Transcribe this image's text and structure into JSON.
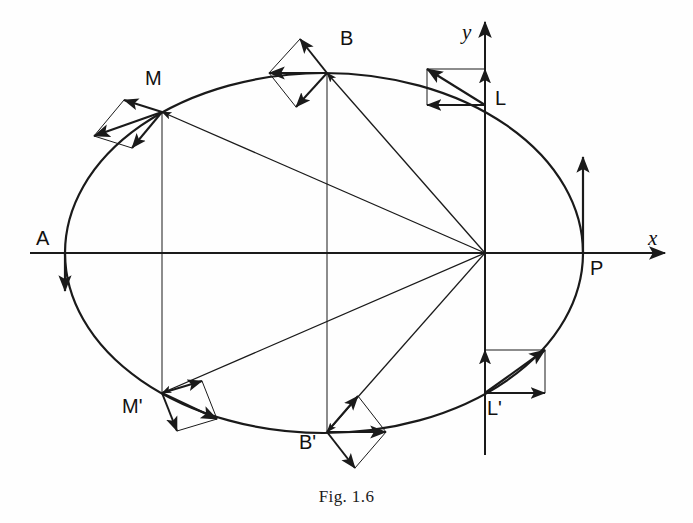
{
  "figure": {
    "caption": "Fig. 1.6",
    "background_color": "#fefefe",
    "stroke_color": "#1a1a1a"
  },
  "axes": {
    "x_label": "x",
    "y_label": "y",
    "origin": {
      "x": 485,
      "y": 253
    },
    "x_axis": {
      "x1": 30,
      "y1": 253,
      "x2": 665,
      "y2": 253,
      "arrow": "right"
    },
    "y_axis": {
      "x1": 485,
      "y1": 455,
      "x2": 485,
      "y2": 22,
      "arrow": "up"
    },
    "x_label_pos": {
      "x": 648,
      "y": 228
    },
    "y_label_pos": {
      "x": 462,
      "y": 22
    }
  },
  "ellipse": {
    "center": {
      "x": 324,
      "y": 253
    },
    "semi_major": 259,
    "semi_minor": 180,
    "stroke_width": 2.2,
    "direction": "counterclockwise"
  },
  "points": [
    {
      "name": "A",
      "label": "A",
      "x": 65,
      "y": 253,
      "label_x": 36,
      "label_y": 228
    },
    {
      "name": "P",
      "label": "P",
      "x": 583,
      "y": 253,
      "label_x": 590,
      "label_y": 258
    },
    {
      "name": "B",
      "label": "B",
      "x": 327,
      "y": 73,
      "label_x": 340,
      "label_y": 28
    },
    {
      "name": "Bp",
      "label": "B'",
      "x": 327,
      "y": 432,
      "label_x": 299,
      "label_y": 432
    },
    {
      "name": "M",
      "label": "M",
      "x": 162,
      "y": 112,
      "label_x": 145,
      "label_y": 68
    },
    {
      "name": "Mp",
      "label": "M'",
      "x": 162,
      "y": 393,
      "label_x": 122,
      "label_y": 396
    },
    {
      "name": "L",
      "label": "L",
      "x": 485,
      "y": 105,
      "label_x": 495,
      "label_y": 88
    },
    {
      "name": "Lp",
      "label": "L'",
      "x": 485,
      "y": 393,
      "label_x": 487,
      "label_y": 398
    }
  ],
  "radius_vectors": [
    {
      "from": "origin",
      "to": "M",
      "x1": 485,
      "y1": 253,
      "x2": 162,
      "y2": 112
    },
    {
      "from": "origin",
      "to": "B",
      "x1": 485,
      "y1": 253,
      "x2": 327,
      "y2": 73
    },
    {
      "from": "origin",
      "to": "Mp",
      "x1": 485,
      "y1": 253,
      "x2": 162,
      "y2": 393
    },
    {
      "from": "origin",
      "to": "Bp",
      "x1": 485,
      "y1": 253,
      "x2": 327,
      "y2": 432
    }
  ],
  "ordinate_lines": [
    {
      "name": "M-ordinate",
      "x1": 162,
      "y1": 112,
      "x2": 162,
      "y2": 393
    },
    {
      "name": "B-ordinate",
      "x1": 327,
      "y1": 73,
      "x2": 327,
      "y2": 432
    }
  ],
  "velocity_parallelograms": [
    {
      "at": "M",
      "apex": {
        "x": 162,
        "y": 112
      },
      "v1": {
        "dx": -38,
        "dy": -12,
        "arrow": true
      },
      "v2": {
        "dx": -30,
        "dy": 36,
        "arrow": true
      },
      "resultant": {
        "dx": -68,
        "dy": 24,
        "arrow": true
      }
    },
    {
      "at": "B",
      "apex": {
        "x": 327,
        "y": 73
      },
      "v1": {
        "dx": -27,
        "dy": -34,
        "arrow": true
      },
      "v2": {
        "dx": -31,
        "dy": 34,
        "arrow": true
      },
      "resultant": {
        "dx": -58,
        "dy": 0,
        "arrow": true
      }
    },
    {
      "at": "L",
      "apex": {
        "x": 485,
        "y": 105
      },
      "v1": {
        "dx": 0,
        "dy": -36,
        "arrow": true
      },
      "v2": {
        "dx": -58,
        "dy": 0,
        "arrow": true
      },
      "resultant": {
        "dx": -58,
        "dy": -36,
        "arrow": true
      }
    },
    {
      "at": "Lp",
      "apex": {
        "x": 485,
        "y": 393
      },
      "v1": {
        "dx": 0,
        "dy": -43,
        "arrow": true
      },
      "v2": {
        "dx": 60,
        "dy": 0,
        "arrow": true
      },
      "resultant": {
        "dx": 60,
        "dy": -43,
        "arrow": true
      }
    },
    {
      "at": "Bp",
      "apex": {
        "x": 327,
        "y": 432
      },
      "v1": {
        "dx": 31,
        "dy": -36,
        "arrow": true
      },
      "v2": {
        "dx": 28,
        "dy": 36,
        "arrow": true
      },
      "resultant": {
        "dx": 59,
        "dy": 0,
        "arrow": true
      }
    },
    {
      "at": "Mp",
      "apex": {
        "x": 162,
        "y": 393
      },
      "v1": {
        "dx": 40,
        "dy": -12,
        "arrow": true
      },
      "v2": {
        "dx": 15,
        "dy": 38,
        "arrow": true
      },
      "resultant": {
        "dx": 55,
        "dy": 26,
        "arrow": true
      }
    }
  ],
  "standalone_arrows": [
    {
      "name": "P-velocity",
      "x1": 583,
      "y1": 253,
      "x2": 583,
      "y2": 157,
      "arrow": "up"
    },
    {
      "name": "A-velocity",
      "x1": 65,
      "y1": 253,
      "x2": 65,
      "y2": 291,
      "arrow": "down"
    }
  ]
}
